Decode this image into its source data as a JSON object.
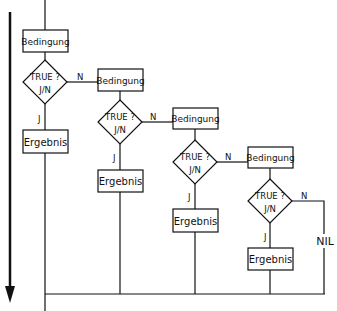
{
  "diagram": {
    "type": "nested-condition-flowchart",
    "flow_direction_arrow": "down",
    "line_color": "#111111",
    "background": "#ffffff",
    "levels": [
      {
        "condition_label": "Bedingung",
        "decision_line1": "TRUE ?",
        "decision_line2": "J/N",
        "yes_label": "J",
        "no_label": "N",
        "result_label": "Ergebnis"
      },
      {
        "condition_label": "Bedingung",
        "decision_line1": "TRUE ?",
        "decision_line2": "J/N",
        "yes_label": "J",
        "no_label": "N",
        "result_label": "Ergebnis"
      },
      {
        "condition_label": "Bedingung",
        "decision_line1": "TRUE ?",
        "decision_line2": "J/N",
        "yes_label": "J",
        "no_label": "N",
        "result_label": "Ergebnis"
      },
      {
        "condition_label": "Bedingung",
        "decision_line1": "TRUE ?",
        "decision_line2": "J/N",
        "yes_label": "J",
        "no_label": "N",
        "result_label": "Ergebnis"
      }
    ],
    "fallthrough_label": "NIL"
  }
}
